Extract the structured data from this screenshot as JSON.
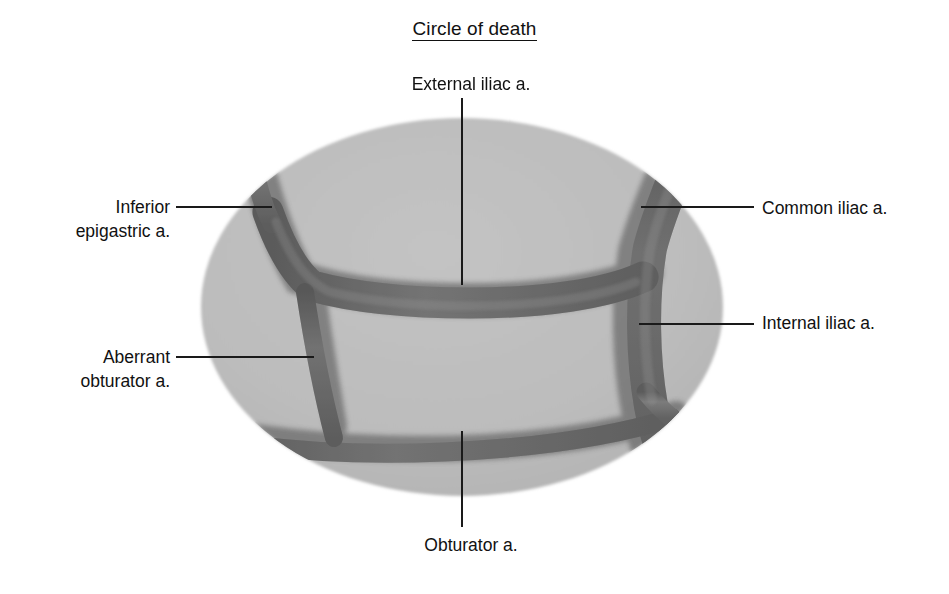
{
  "figure": {
    "title": "Circle of death",
    "title_underlined": true,
    "background_color": "#ffffff",
    "field_color": "#b9b9b9",
    "vessel_color": "#6e6e6e",
    "vessel_edge_color": "#4a4a4a",
    "leader_color": "#1a1a1a",
    "text_color": "#111111"
  },
  "labels": {
    "external_iliac": "External iliac a.",
    "common_iliac": "Common iliac a.",
    "internal_iliac": "Internal iliac a.",
    "inferior_epigastric": "Inferior\nepigastric a.",
    "aberrant_obturator": "Aberrant\nobturator a.",
    "obturator": "Obturator a."
  },
  "structures": [
    {
      "name": "external-iliac-artery",
      "label": "External iliac a.",
      "label_position": "top-center",
      "leader_from": [
        462,
        98
      ],
      "leader_to": [
        462,
        285
      ]
    },
    {
      "name": "common-iliac-artery",
      "label": "Common iliac a.",
      "label_position": "right-upper",
      "leader_from": [
        754,
        207
      ],
      "leader_to": [
        641,
        207
      ]
    },
    {
      "name": "internal-iliac-artery",
      "label": "Internal iliac a.",
      "label_position": "right-lower",
      "leader_from": [
        754,
        324
      ],
      "leader_to": [
        639,
        324
      ]
    },
    {
      "name": "inferior-epigastric-artery",
      "label": "Inferior epigastric a.",
      "label_position": "left-upper",
      "leader_from": [
        176,
        207
      ],
      "leader_to": [
        272,
        207
      ]
    },
    {
      "name": "aberrant-obturator-artery",
      "label": "Aberrant obturator a.",
      "label_position": "left-lower",
      "leader_from": [
        176,
        357
      ],
      "leader_to": [
        314,
        357
      ]
    },
    {
      "name": "obturator-artery",
      "label": "Obturator a.",
      "label_position": "bottom-center",
      "leader_from": [
        462,
        527
      ],
      "leader_to": [
        462,
        431
      ]
    }
  ]
}
